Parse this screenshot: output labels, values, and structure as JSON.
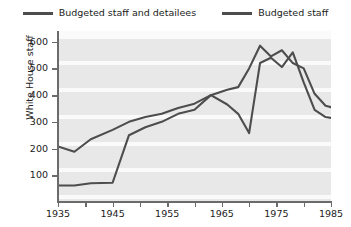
{
  "chart_data": {
    "type": "line",
    "title": "",
    "xlabel": "",
    "ylabel": "White House staff",
    "xlim": [
      1935,
      1985
    ],
    "ylim": [
      0,
      640
    ],
    "xticks": [
      1935,
      1945,
      1955,
      1965,
      1975,
      1985
    ],
    "xtick_labels": [
      "1935",
      "1945",
      "1955",
      "1965",
      "1975",
      "1985"
    ],
    "xminor_ticks": [
      1940,
      1950,
      1960,
      1970,
      1980
    ],
    "yticks": [
      100,
      200,
      300,
      400,
      500,
      600
    ],
    "ytick_labels": [
      "100",
      "200",
      "300",
      "400",
      "500",
      "600"
    ],
    "grid": "horizontal-banded",
    "legend_position": "top-center",
    "line_color": "#4d4d4d",
    "plot_background": "#e8e8e8",
    "series": [
      {
        "name": "Budgeted staff and detailees",
        "x": [
          1935,
          1938,
          1941,
          1945,
          1948,
          1951,
          1954,
          1957,
          1960,
          1963,
          1966,
          1968,
          1970,
          1972,
          1974,
          1976,
          1978,
          1980,
          1982,
          1984,
          1985
        ],
        "values": [
          208,
          188,
          235,
          270,
          300,
          318,
          330,
          352,
          368,
          400,
          420,
          430,
          500,
          585,
          545,
          568,
          520,
          500,
          405,
          360,
          355
        ]
      },
      {
        "name": "Budgeted staff",
        "x": [
          1935,
          1938,
          1941,
          1945,
          1948,
          1951,
          1954,
          1957,
          1960,
          1963,
          1966,
          1968,
          1970,
          1972,
          1974,
          1976,
          1978,
          1980,
          1982,
          1984,
          1985
        ],
        "values": [
          62,
          62,
          70,
          72,
          250,
          280,
          300,
          330,
          345,
          400,
          365,
          330,
          258,
          520,
          540,
          505,
          560,
          448,
          345,
          318,
          315
        ]
      }
    ]
  },
  "legend": {
    "items": [
      {
        "label": "Budgeted staff and detailees"
      },
      {
        "label": "Budgeted staff"
      }
    ]
  }
}
